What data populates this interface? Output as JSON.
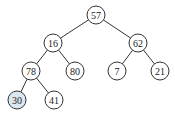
{
  "diagram": {
    "type": "binary-tree",
    "highlight_color": "#dce8ef",
    "nodes": [
      {
        "id": "n57",
        "label": "57",
        "highlighted": false
      },
      {
        "id": "n16",
        "label": "16",
        "highlighted": false
      },
      {
        "id": "n62",
        "label": "62",
        "highlighted": false
      },
      {
        "id": "n78",
        "label": "78",
        "highlighted": false
      },
      {
        "id": "n80",
        "label": "80",
        "highlighted": false
      },
      {
        "id": "n7",
        "label": "7",
        "highlighted": false
      },
      {
        "id": "n21",
        "label": "21",
        "highlighted": false
      },
      {
        "id": "n30",
        "label": "30",
        "highlighted": true
      },
      {
        "id": "n41",
        "label": "41",
        "highlighted": false
      }
    ],
    "edges": [
      {
        "from": "n57",
        "to": "n16"
      },
      {
        "from": "n57",
        "to": "n62"
      },
      {
        "from": "n16",
        "to": "n78"
      },
      {
        "from": "n16",
        "to": "n80"
      },
      {
        "from": "n62",
        "to": "n7"
      },
      {
        "from": "n62",
        "to": "n21"
      },
      {
        "from": "n78",
        "to": "n30"
      },
      {
        "from": "n78",
        "to": "n41"
      }
    ]
  }
}
